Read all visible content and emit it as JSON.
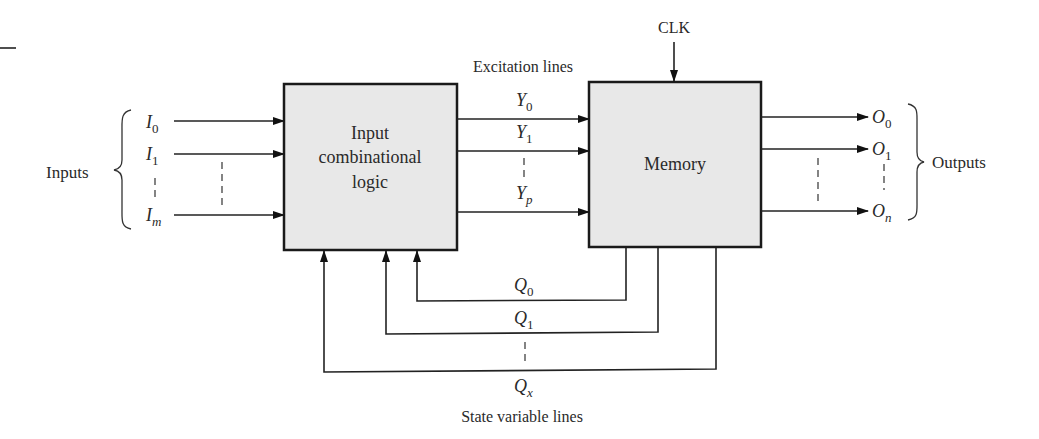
{
  "diagram": {
    "blocks": {
      "logic": {
        "line1": "Input",
        "line2": "combinational",
        "line3": "logic"
      },
      "memory": {
        "label": "Memory"
      }
    },
    "group_labels": {
      "inputs": "Inputs",
      "outputs": "Outputs",
      "excitation": "Excitation lines",
      "state": "State variable lines",
      "clock": "CLK"
    },
    "inputs": [
      {
        "base": "I",
        "sub": "0"
      },
      {
        "base": "I",
        "sub": "1"
      },
      {
        "base": "I",
        "sub": "m"
      }
    ],
    "excitation_lines": [
      {
        "base": "Y",
        "sub": "0"
      },
      {
        "base": "Y",
        "sub": "1"
      },
      {
        "base": "Y",
        "sub": "p"
      }
    ],
    "outputs": [
      {
        "base": "O",
        "sub": "0"
      },
      {
        "base": "O",
        "sub": "1"
      },
      {
        "base": "O",
        "sub": "n"
      }
    ],
    "state_lines": [
      {
        "base": "Q",
        "sub": "0"
      },
      {
        "base": "Q",
        "sub": "1"
      },
      {
        "base": "Q",
        "sub": "x"
      }
    ]
  }
}
